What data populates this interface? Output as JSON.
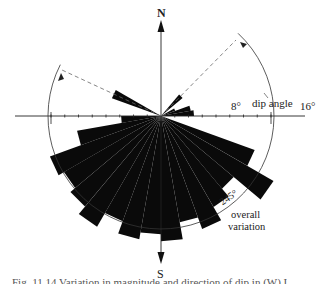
{
  "figure": {
    "north_label": "N",
    "south_label": "S",
    "tick_label_8": "8°",
    "tick_label_16": "16°",
    "dip_angle_label": "dip angle",
    "variation_angle_label": "245°",
    "variation_label_line1": "overall",
    "variation_label_line2": "variation",
    "caption": "Fig. 11.14 Variation in magnitude and direction of dip in (W) I"
  },
  "chart_data": {
    "type": "rose",
    "title": "",
    "center_px": [
      161,
      116
    ],
    "radius_scale": {
      "degrees": 16,
      "px": 110
    },
    "axis_ticks_deg": [
      2,
      4,
      6,
      8,
      10,
      12,
      14,
      16
    ],
    "axis_labels": [
      "8°",
      "16°"
    ],
    "axis_title": "dip angle",
    "bin_width_deg": 10,
    "petals": [
      {
        "from": 40,
        "to": 50,
        "value": 4.1
      },
      {
        "from": 60,
        "to": 70,
        "value": 2.2
      },
      {
        "from": 70,
        "to": 80,
        "value": 4.4
      },
      {
        "from": 80,
        "to": 90,
        "value": 4.8
      },
      {
        "from": 110,
        "to": 120,
        "value": 14.5
      },
      {
        "from": 120,
        "to": 130,
        "value": 18.9
      },
      {
        "from": 130,
        "to": 140,
        "value": 13.8
      },
      {
        "from": 140,
        "to": 150,
        "value": 15.3
      },
      {
        "from": 150,
        "to": 160,
        "value": 17.5
      },
      {
        "from": 160,
        "to": 170,
        "value": 15.7
      },
      {
        "from": 170,
        "to": 180,
        "value": 18.2
      },
      {
        "from": 180,
        "to": 190,
        "value": 17.2
      },
      {
        "from": 190,
        "to": 200,
        "value": 18.2
      },
      {
        "from": 200,
        "to": 210,
        "value": 16.3
      },
      {
        "from": 210,
        "to": 220,
        "value": 18.6
      },
      {
        "from": 220,
        "to": 230,
        "value": 17.2
      },
      {
        "from": 230,
        "to": 240,
        "value": 16.3
      },
      {
        "from": 240,
        "to": 250,
        "value": 17.2
      },
      {
        "from": 250,
        "to": 260,
        "value": 12.4
      },
      {
        "from": 260,
        "to": 270,
        "value": 5.8
      },
      {
        "from": 290,
        "to": 300,
        "value": 7.6
      }
    ],
    "variation_range": {
      "from_azimuth": 45,
      "to_azimuth": 295,
      "label": "245° overall variation"
    },
    "colors": {
      "petal": "#0a0a0a",
      "axis": "#222222",
      "arc": "#333333",
      "dashed": "#555555"
    }
  }
}
